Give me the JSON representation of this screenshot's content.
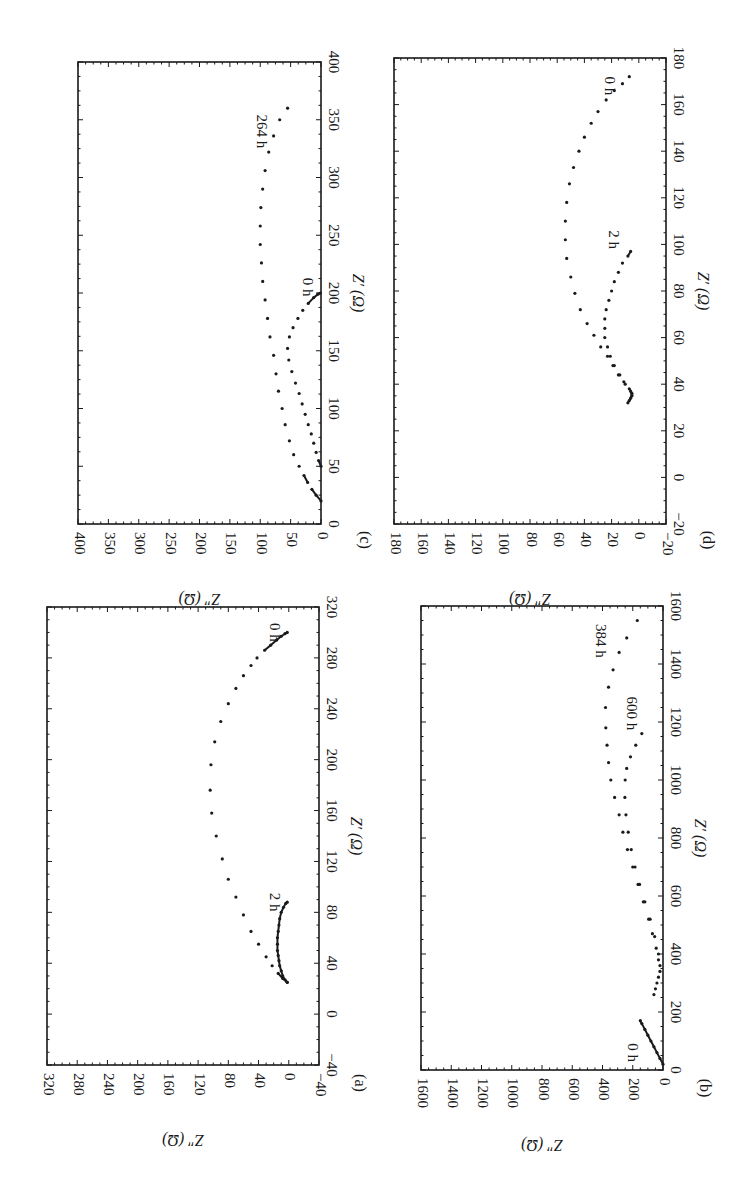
{
  "figure": {
    "rotation_deg": 90,
    "panel_labels": [
      "(a)",
      "(b)",
      "(c)",
      "(d)"
    ]
  },
  "chart_data": [
    {
      "panel": "(a)",
      "type": "scatter",
      "title": "",
      "xlabel": "Z′ (Ω)",
      "ylabel": "Z″ (Ω)",
      "xlim": [
        -40,
        320
      ],
      "ylim": [
        -40,
        320
      ],
      "xticks": [
        -40,
        0,
        40,
        80,
        120,
        160,
        200,
        240,
        280,
        320
      ],
      "yticks": [
        -40,
        0,
        40,
        80,
        120,
        160,
        200,
        240,
        280,
        320
      ],
      "grid": false,
      "annotations": [
        {
          "text": "0 h",
          "x": 300,
          "y": 25
        },
        {
          "text": "2 h",
          "x": 88,
          "y": 25
        }
      ],
      "series": [
        {
          "name": "0 h",
          "x": [
            25,
            28,
            32,
            38,
            45,
            55,
            65,
            78,
            92,
            106,
            122,
            140,
            158,
            176,
            196,
            214,
            230,
            244,
            256,
            266,
            274,
            280,
            286,
            290,
            294,
            297,
            299,
            300
          ],
          "y": [
            2,
            8,
            14,
            22,
            30,
            40,
            50,
            60,
            70,
            80,
            88,
            96,
            102,
            104,
            103,
            98,
            90,
            80,
            70,
            60,
            50,
            42,
            32,
            24,
            16,
            10,
            5,
            2
          ]
        },
        {
          "name": "2 h",
          "x": [
            25,
            27,
            30,
            34,
            38,
            42,
            46,
            50,
            55,
            60,
            65,
            70,
            75,
            80,
            84,
            87,
            88
          ],
          "y": [
            2,
            5,
            8,
            10,
            12,
            13,
            14,
            15,
            15,
            15,
            14,
            13,
            12,
            10,
            7,
            4,
            2
          ]
        }
      ]
    },
    {
      "panel": "(b)",
      "type": "scatter",
      "title": "",
      "xlabel": "Z′ (Ω)",
      "ylabel": "Z″ (Ω)",
      "xlim": [
        0,
        1600
      ],
      "ylim": [
        0,
        1600
      ],
      "xticks": [
        0,
        200,
        400,
        600,
        800,
        1000,
        1200,
        1400,
        1600
      ],
      "yticks": [
        0,
        200,
        400,
        600,
        800,
        1000,
        1200,
        1400,
        1600
      ],
      "grid": false,
      "annotations": [
        {
          "text": "0 h",
          "x": 60,
          "y": 230
        },
        {
          "text": "384 h",
          "x": 1480,
          "y": 440
        },
        {
          "text": "600 h",
          "x": 1230,
          "y": 240
        }
      ],
      "series": [
        {
          "name": "0 h",
          "x": [
            20,
            40,
            60,
            80,
            100,
            120,
            140,
            160,
            170
          ],
          "y": [
            0,
            20,
            40,
            60,
            80,
            100,
            120,
            140,
            150
          ]
        },
        {
          "name": "384 h",
          "x": [
            260,
            300,
            340,
            380,
            420,
            470,
            520,
            580,
            640,
            700,
            760,
            820,
            880,
            940,
            1000,
            1060,
            1120,
            1180,
            1250,
            1320,
            1380,
            1440,
            1490,
            1550
          ],
          "y": [
            60,
            40,
            20,
            30,
            45,
            70,
            95,
            130,
            165,
            200,
            235,
            265,
            290,
            320,
            345,
            360,
            370,
            378,
            380,
            360,
            330,
            290,
            240,
            170
          ]
        },
        {
          "name": "600 h",
          "x": [
            280,
            320,
            360,
            400,
            460,
            520,
            580,
            640,
            700,
            760,
            820,
            880,
            940,
            1000,
            1040,
            1080,
            1120,
            1160
          ],
          "y": [
            50,
            30,
            20,
            30,
            55,
            85,
            120,
            155,
            185,
            210,
            230,
            245,
            252,
            250,
            240,
            215,
            180,
            140
          ]
        }
      ]
    },
    {
      "panel": "(c)",
      "type": "scatter",
      "title": "",
      "xlabel": "Z′ (Ω)",
      "ylabel": "Z″ (Ω)",
      "xlim": [
        0,
        400
      ],
      "ylim": [
        0,
        400
      ],
      "xticks": [
        0,
        50,
        100,
        150,
        200,
        250,
        300,
        350,
        400
      ],
      "yticks": [
        0,
        50,
        100,
        150,
        200,
        250,
        300,
        350,
        400
      ],
      "grid": false,
      "annotations": [
        {
          "text": "0 h",
          "x": 205,
          "y": 30
        },
        {
          "text": "264 h",
          "x": 340,
          "y": 105
        }
      ],
      "series": [
        {
          "name": "0 h",
          "x": [
            50,
            55,
            62,
            70,
            78,
            86,
            95,
            104,
            113,
            122,
            132,
            142,
            152,
            162,
            170,
            178,
            185,
            191,
            196,
            199,
            200
          ],
          "y": [
            0,
            4,
            8,
            12,
            16,
            21,
            26,
            31,
            36,
            42,
            48,
            53,
            55,
            52,
            46,
            38,
            30,
            21,
            12,
            5,
            1
          ]
        },
        {
          "name": "264 h",
          "x": [
            20,
            25,
            30,
            36,
            42,
            50,
            60,
            72,
            86,
            100,
            115,
            130,
            146,
            162,
            178,
            194,
            210,
            226,
            242,
            258,
            274,
            290,
            306,
            322,
            336,
            350,
            360
          ],
          "y": [
            0,
            8,
            15,
            22,
            28,
            36,
            45,
            52,
            59,
            64,
            70,
            74,
            78,
            84,
            88,
            92,
            96,
            98,
            100,
            100,
            99,
            96,
            92,
            86,
            78,
            68,
            55
          ]
        }
      ]
    },
    {
      "panel": "(d)",
      "type": "scatter",
      "title": "",
      "xlabel": "Z′ (Ω)",
      "ylabel": "Z″ (Ω)",
      "xlim": [
        -20,
        180
      ],
      "ylim": [
        -20,
        180
      ],
      "xticks": [
        -20,
        0,
        20,
        40,
        60,
        80,
        100,
        120,
        140,
        160,
        180
      ],
      "yticks": [
        -20,
        0,
        20,
        40,
        60,
        80,
        100,
        120,
        140,
        160,
        180
      ],
      "grid": false,
      "annotations": [
        {
          "text": "0 h",
          "x": 168,
          "y": 25
        },
        {
          "text": "2 h",
          "x": 102,
          "y": 22
        }
      ],
      "series": [
        {
          "name": "0 h",
          "x": [
            32,
            34,
            36,
            38,
            41,
            44,
            48,
            52,
            56,
            61,
            66,
            72,
            79,
            86,
            94,
            102,
            110,
            118,
            126,
            133,
            140,
            146,
            152,
            157,
            162,
            166,
            169,
            172
          ],
          "y": [
            8,
            6,
            5,
            7,
            11,
            15,
            19,
            23,
            28,
            33,
            38,
            43,
            47,
            50,
            53,
            54,
            54,
            53,
            51,
            48,
            44,
            40,
            35,
            30,
            24,
            18,
            12,
            7
          ]
        },
        {
          "name": "2 h",
          "x": [
            33,
            35,
            37,
            40,
            44,
            48,
            52,
            56,
            60,
            64,
            68,
            72,
            76,
            80,
            84,
            88,
            92,
            95,
            97
          ],
          "y": [
            7,
            5,
            6,
            10,
            14,
            18,
            21,
            23,
            25,
            25,
            25,
            24,
            22,
            20,
            18,
            15,
            12,
            8,
            6
          ]
        }
      ]
    }
  ]
}
